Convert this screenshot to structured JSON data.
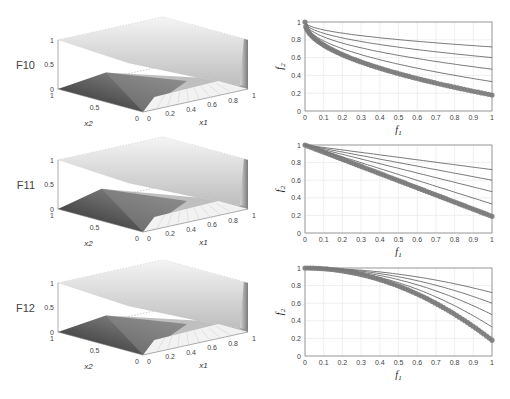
{
  "figure": {
    "rows": [
      {
        "label": "F10",
        "x1_label": "x1",
        "x2_label": "x2"
      },
      {
        "label": "F11",
        "x1_label": "x1",
        "x2_label": "x2"
      },
      {
        "label": "F12",
        "x1_label": "x1",
        "x2_label": "x2"
      }
    ],
    "surface_ticks": {
      "z": [
        "0",
        "0.5",
        "1"
      ],
      "x2": [
        "1",
        "0.5",
        "0"
      ],
      "x1": [
        "0",
        "0.2",
        "0.4",
        "0.6",
        "0.8",
        "1"
      ]
    },
    "colors": {
      "dots": "#7a7a7a",
      "lines": "#555555",
      "axis": "#888888",
      "grid": "#e4e4e4"
    }
  },
  "chart_data": [
    {
      "type": "surface",
      "title": "F10",
      "xlabel": "x1",
      "ylabel": "x2",
      "zlabel": "F10",
      "xlim": [
        0,
        1
      ],
      "ylim": [
        0,
        1
      ],
      "zlim": [
        0,
        1
      ]
    },
    {
      "type": "line",
      "title": "",
      "xlabel": "f1",
      "ylabel": "f2",
      "xlim": [
        0,
        1
      ],
      "ylim": [
        0,
        1
      ],
      "xticks": [
        "0",
        "0.1",
        "0.2",
        "0.3",
        "0.4",
        "0.5",
        "0.6",
        "0.7",
        "0.8",
        "0.9",
        "1"
      ],
      "yticks": [
        "0",
        "0.2",
        "0.4",
        "0.6",
        "0.8",
        "1"
      ],
      "grid": true,
      "series": [
        {
          "name": "curve1",
          "style": "line",
          "end_value": 0.72,
          "shape": "concave"
        },
        {
          "name": "curve2",
          "style": "line",
          "end_value": 0.6,
          "shape": "concave"
        },
        {
          "name": "curve3",
          "style": "line",
          "end_value": 0.47,
          "shape": "concave"
        },
        {
          "name": "curve4",
          "style": "line",
          "end_value": 0.33,
          "shape": "concave"
        },
        {
          "name": "pareto_front",
          "style": "markers",
          "end_value": 0.18,
          "shape": "concave",
          "x": [
            0,
            0.05,
            0.1,
            0.2,
            0.3,
            0.4,
            0.5,
            0.6,
            0.7,
            0.8,
            0.9,
            1
          ],
          "values": [
            1.0,
            0.84,
            0.76,
            0.64,
            0.55,
            0.47,
            0.41,
            0.36,
            0.31,
            0.27,
            0.22,
            0.18
          ]
        }
      ]
    },
    {
      "type": "surface",
      "title": "F11",
      "xlabel": "x1",
      "ylabel": "x2",
      "zlabel": "F11",
      "xlim": [
        0,
        1
      ],
      "ylim": [
        0,
        1
      ],
      "zlim": [
        0,
        1
      ]
    },
    {
      "type": "line",
      "title": "",
      "xlabel": "f1",
      "ylabel": "f2",
      "xlim": [
        0,
        1
      ],
      "ylim": [
        0,
        1
      ],
      "xticks": [
        "0",
        "0.1",
        "0.2",
        "0.3",
        "0.4",
        "0.5",
        "0.6",
        "0.7",
        "0.8",
        "0.9",
        "1"
      ],
      "yticks": [
        "0",
        "0.2",
        "0.4",
        "0.6",
        "0.8",
        "1"
      ],
      "grid": true,
      "series": [
        {
          "name": "curve1",
          "style": "line",
          "end_value": 0.72,
          "shape": "linear"
        },
        {
          "name": "curve2",
          "style": "line",
          "end_value": 0.6,
          "shape": "linear"
        },
        {
          "name": "curve3",
          "style": "line",
          "end_value": 0.47,
          "shape": "linear"
        },
        {
          "name": "curve4",
          "style": "line",
          "end_value": 0.33,
          "shape": "linear"
        },
        {
          "name": "pareto_front",
          "style": "markers",
          "end_value": 0.19,
          "shape": "linear",
          "x": [
            0,
            0.1,
            0.2,
            0.3,
            0.4,
            0.5,
            0.6,
            0.7,
            0.8,
            0.9,
            1
          ],
          "values": [
            1.0,
            0.91,
            0.83,
            0.75,
            0.67,
            0.59,
            0.51,
            0.43,
            0.35,
            0.27,
            0.19
          ]
        }
      ]
    },
    {
      "type": "surface",
      "title": "F12",
      "xlabel": "x1",
      "ylabel": "x2",
      "zlabel": "F12",
      "xlim": [
        0,
        1
      ],
      "ylim": [
        0,
        1
      ],
      "zlim": [
        0,
        1
      ]
    },
    {
      "type": "line",
      "title": "",
      "xlabel": "f1",
      "ylabel": "f2",
      "xlim": [
        0,
        1
      ],
      "ylim": [
        0,
        1
      ],
      "xticks": [
        "0",
        "0.1",
        "0.2",
        "0.3",
        "0.4",
        "0.5",
        "0.6",
        "0.7",
        "0.8",
        "0.9",
        "1"
      ],
      "yticks": [
        "0",
        "0.2",
        "0.4",
        "0.6",
        "0.8",
        "1"
      ],
      "grid": true,
      "series": [
        {
          "name": "curve1",
          "style": "line",
          "end_value": 0.72,
          "shape": "convex"
        },
        {
          "name": "curve2",
          "style": "line",
          "end_value": 0.6,
          "shape": "convex"
        },
        {
          "name": "curve3",
          "style": "line",
          "end_value": 0.47,
          "shape": "convex"
        },
        {
          "name": "curve4",
          "style": "line",
          "end_value": 0.33,
          "shape": "convex"
        },
        {
          "name": "pareto_front",
          "style": "markers",
          "end_value": 0.18,
          "shape": "convex",
          "x": [
            0,
            0.1,
            0.2,
            0.3,
            0.4,
            0.5,
            0.6,
            0.7,
            0.8,
            0.9,
            1
          ],
          "values": [
            1.0,
            0.97,
            0.93,
            0.86,
            0.78,
            0.69,
            0.59,
            0.49,
            0.39,
            0.28,
            0.18
          ]
        }
      ]
    }
  ]
}
